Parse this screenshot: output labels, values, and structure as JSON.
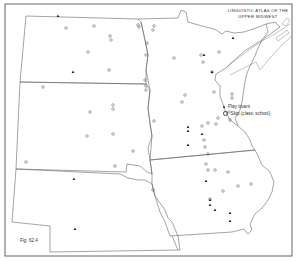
{
  "map": {
    "title_line1": "LINGUISTIC ATLAS OF THE",
    "title_line2": "UPPER MIDWEST",
    "figure_label": "Fig. 62.4",
    "legend": [
      {
        "symbol": "triangle-filled",
        "label": "Play truant"
      },
      {
        "symbol": "circle-open",
        "label": "Skip (class; school)"
      }
    ],
    "colors": {
      "ink": "#333333",
      "paper": "#ffffff",
      "border": "#555555"
    },
    "markers": {
      "triangles": [
        [
          58,
          16
        ],
        [
          73,
          72
        ],
        [
          74,
          179
        ],
        [
          75,
          229
        ],
        [
          204,
          55
        ],
        [
          212,
          72
        ],
        [
          233,
          38
        ],
        [
          202,
          134
        ],
        [
          188,
          127
        ],
        [
          188,
          131
        ],
        [
          188,
          145
        ],
        [
          206,
          181
        ],
        [
          210,
          200
        ],
        [
          210,
          205
        ],
        [
          215,
          210
        ],
        [
          230,
          213
        ],
        [
          230,
          221
        ]
      ],
      "circles": [
        [
          66,
          28
        ],
        [
          94,
          26
        ],
        [
          110,
          36
        ],
        [
          111,
          40
        ],
        [
          139,
          27
        ],
        [
          138,
          25
        ],
        [
          147,
          43
        ],
        [
          146,
          55
        ],
        [
          146,
          86
        ],
        [
          146,
          90
        ],
        [
          154,
          26
        ],
        [
          153,
          30
        ],
        [
          145,
          80
        ],
        [
          88,
          52
        ],
        [
          109,
          70
        ],
        [
          43,
          87
        ],
        [
          90,
          112
        ],
        [
          113,
          105
        ],
        [
          113,
          109
        ],
        [
          87,
          136
        ],
        [
          113,
          134
        ],
        [
          133,
          151
        ],
        [
          115,
          166
        ],
        [
          26,
          162
        ],
        [
          154,
          121
        ],
        [
          174,
          58
        ],
        [
          203,
          62
        ],
        [
          201,
          55
        ],
        [
          219,
          52
        ],
        [
          212,
          72
        ],
        [
          185,
          95
        ],
        [
          182,
          102
        ],
        [
          214,
          92
        ],
        [
          232,
          94
        ],
        [
          232,
          98
        ],
        [
          202,
          126
        ],
        [
          208,
          123
        ],
        [
          218,
          118
        ],
        [
          216,
          124
        ],
        [
          229,
          112
        ],
        [
          230,
          120
        ],
        [
          204,
          140
        ],
        [
          205,
          147
        ],
        [
          208,
          154
        ],
        [
          206,
          164
        ],
        [
          208,
          170
        ],
        [
          215,
          170
        ],
        [
          228,
          172
        ],
        [
          223,
          191
        ],
        [
          238,
          186
        ],
        [
          251,
          184
        ],
        [
          210,
          199
        ],
        [
          153,
          190
        ]
      ]
    }
  }
}
